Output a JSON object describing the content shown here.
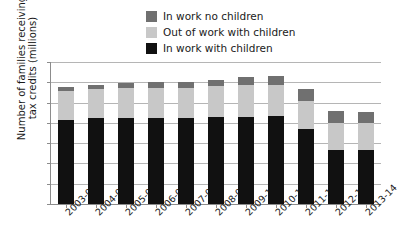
{
  "chart_data": {
    "type": "bar",
    "subtype": "stacked-vertical",
    "title": "",
    "xlabel": "",
    "ylabel": "Number of families receiving\ntax credits (millions)",
    "ylim": [
      0,
      7
    ],
    "yticks": [
      0,
      1,
      2,
      3,
      4,
      5,
      6,
      7
    ],
    "ytick_labels": [
      "0",
      "1",
      "2",
      "3",
      "4",
      "5",
      "6",
      "7"
    ],
    "grid": true,
    "grid_axis": "y",
    "legend_position": "top-center",
    "categories": [
      "2003-04",
      "2004-05",
      "2005-06",
      "2006-07",
      "2007-08",
      "2008-09",
      "2009-10",
      "2010-11",
      "2011-12",
      "2012-13",
      "2013-14"
    ],
    "series": [
      {
        "name": "In work with children",
        "color": "#111111",
        "values": [
          4.15,
          4.25,
          4.25,
          4.25,
          4.25,
          4.3,
          4.3,
          4.35,
          3.7,
          2.65,
          2.65
        ]
      },
      {
        "name": "Out of work with children",
        "color": "#c8c8c8",
        "values": [
          1.4,
          1.4,
          1.45,
          1.45,
          1.45,
          1.5,
          1.55,
          1.5,
          1.4,
          1.35,
          1.35
        ]
      },
      {
        "name": "In work no children",
        "color": "#707070",
        "values": [
          0.2,
          0.2,
          0.25,
          0.3,
          0.3,
          0.3,
          0.4,
          0.45,
          0.55,
          0.6,
          0.55
        ]
      }
    ],
    "totals": [
      5.75,
      5.85,
      5.95,
      6.0,
      6.0,
      6.1,
      6.25,
      6.3,
      5.65,
      4.6,
      4.55
    ]
  },
  "legend": {
    "items": [
      {
        "label": "In work no children",
        "color": "#707070",
        "swatch_name": "legend-swatch-in-work-no-children"
      },
      {
        "label": "Out of work with children",
        "color": "#c8c8c8",
        "swatch_name": "legend-swatch-out-of-work-with-children"
      },
      {
        "label": "In work with children",
        "color": "#111111",
        "swatch_name": "legend-swatch-in-work-with-children"
      }
    ]
  },
  "axes": {
    "y_title": "Number of families receiving\ntax credits (millions)"
  },
  "colors": {
    "gridline": "#b5b5b5",
    "axis": "#8c8c8c",
    "text": "#1a1a1a",
    "background": "#ffffff"
  }
}
